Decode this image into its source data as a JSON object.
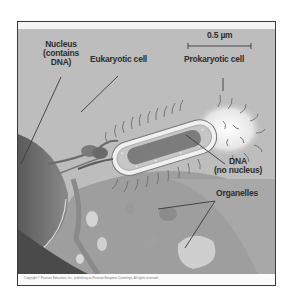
{
  "figure": {
    "scale_bar": {
      "label": "0.5 µm"
    },
    "labels": {
      "nucleus_line1": "Nucleus",
      "nucleus_line2": "(contains",
      "nucleus_line3": "DNA)",
      "eukaryotic": "Eukaryotic cell",
      "prokaryotic": "Prokaryotic cell",
      "dna_line1": "DNA",
      "dna_line2": "(no nucleus)",
      "organelles": "Organelles"
    },
    "caption": "Copyright © Pearson Education, Inc., publishing as Pearson Benjamin Cummings. All rights reserved.",
    "colors": {
      "background": "#b9b9b9",
      "label_text": "#2e2e2e",
      "frame_border": "#3a3a3a"
    }
  }
}
